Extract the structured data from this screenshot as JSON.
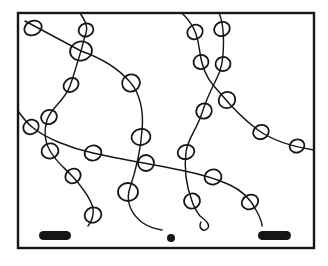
{
  "figure": {
    "canvas": {
      "width": 328,
      "height": 266,
      "background": "#ffffff"
    },
    "ink_color": "#161616",
    "frame": {
      "x": 18,
      "y": 13,
      "width": 296,
      "height": 235,
      "stroke_width": 2.4
    },
    "strand_stroke_width": 1.45,
    "bead_stroke_width": 1.8,
    "strands": [
      {
        "name": "strand-top-left-diagonal",
        "path": "M 25 21 L 81 51 C 101 58 118 68 130 82 C 140 93 144 112 142 130 C 141 148 136 170 129 191 C 126 204 133 216 143 223 C 149 227 156 229 162 230"
      },
      {
        "name": "strand-left-vertical",
        "path": "M 80 13 C 86 22 88 27 86 33 C 83 42 83 44 81 51 C 76 66 75 72 70 86 C 64 102 51 107 47 120 C 44 130 44 141 50 151 C 58 164 65 168 73 177 C 82 187 90 197 93 208 C 94 216 92 221 88 226"
      },
      {
        "name": "strand-middle-s-curve",
        "path": "M 219 13 C 223 22 224 40 223 55 C 222 68 219 74 215 82 C 208 96 206 100 202 113 C 196 131 188 138 186 152 C 184 168 186 185 192 201 C 194 208 197 212 200 216 C 207 221 211 226 207 229 C 203 232 198 228 201 222"
      },
      {
        "name": "strand-right-sweep",
        "path": "M 182 13 C 189 20 193 25 196 34 C 200 46 199 52 202 63 C 206 78 212 84 220 93 C 230 105 243 119 258 130 C 273 141 295 147 314 150"
      },
      {
        "name": "strand-long-horizontal",
        "path": "M 18 111 C 23 118 26 122 32 127 C 45 138 70 148 93 153 C 120 159 150 164 180 170 C 200 174 215 178 230 185 C 243 191 251 200 256 210 C 260 217 262 221 262 226"
      }
    ],
    "beads": [
      {
        "cx": 33,
        "cy": 28,
        "rx": 9,
        "ry": 7,
        "rot": -25
      },
      {
        "cx": 81,
        "cy": 51,
        "rx": 11,
        "ry": 9.5,
        "rot": -10
      },
      {
        "cx": 131,
        "cy": 83,
        "rx": 9,
        "ry": 8.5,
        "rot": -30
      },
      {
        "cx": 141,
        "cy": 137,
        "rx": 9.5,
        "ry": 8,
        "rot": -10
      },
      {
        "cx": 128,
        "cy": 192,
        "rx": 10,
        "ry": 9,
        "rot": 0
      },
      {
        "cx": 86,
        "cy": 30,
        "rx": 7.5,
        "ry": 6.5,
        "rot": -20
      },
      {
        "cx": 71,
        "cy": 85,
        "rx": 8,
        "ry": 6.5,
        "rot": -35
      },
      {
        "cx": 49,
        "cy": 117,
        "rx": 8,
        "ry": 7,
        "rot": -20
      },
      {
        "cx": 50,
        "cy": 151,
        "rx": 8.5,
        "ry": 7.5,
        "rot": -10
      },
      {
        "cx": 73,
        "cy": 176,
        "rx": 8,
        "ry": 7,
        "rot": -35
      },
      {
        "cx": 93,
        "cy": 215,
        "rx": 8.5,
        "ry": 7.5,
        "rot": -20
      },
      {
        "cx": 222,
        "cy": 29,
        "rx": 8,
        "ry": 7,
        "rot": -25
      },
      {
        "cx": 223,
        "cy": 64,
        "rx": 7.5,
        "ry": 7,
        "rot": -10
      },
      {
        "cx": 204,
        "cy": 111,
        "rx": 8,
        "ry": 7.5,
        "rot": -40
      },
      {
        "cx": 186,
        "cy": 152,
        "rx": 8.5,
        "ry": 7,
        "rot": -20
      },
      {
        "cx": 192,
        "cy": 201,
        "rx": 8,
        "ry": 7.5,
        "rot": -15
      },
      {
        "cx": 195,
        "cy": 32,
        "rx": 8,
        "ry": 7,
        "rot": -30
      },
      {
        "cx": 201,
        "cy": 62,
        "rx": 7.5,
        "ry": 7,
        "rot": -15
      },
      {
        "cx": 227,
        "cy": 100,
        "rx": 8.5,
        "ry": 8,
        "rot": -40
      },
      {
        "cx": 261,
        "cy": 132,
        "rx": 8,
        "ry": 7,
        "rot": -25
      },
      {
        "cx": 297,
        "cy": 146,
        "rx": 7.5,
        "ry": 6.5,
        "rot": -20
      },
      {
        "cx": 31,
        "cy": 127,
        "rx": 8,
        "ry": 7,
        "rot": -30
      },
      {
        "cx": 93,
        "cy": 153,
        "rx": 8.5,
        "ry": 7.5,
        "rot": -15
      },
      {
        "cx": 146,
        "cy": 163,
        "rx": 8,
        "ry": 8,
        "rot": 0
      },
      {
        "cx": 213,
        "cy": 177,
        "rx": 8.5,
        "ry": 7.5,
        "rot": -10
      },
      {
        "cx": 250,
        "cy": 202,
        "rx": 8.5,
        "ry": 7,
        "rot": -25
      }
    ],
    "markers": {
      "scale_bar_left": {
        "x": 39,
        "y": 231,
        "width": 32,
        "height": 9,
        "radius": 4.5
      },
      "dot": {
        "cx": 171,
        "cy": 238,
        "r": 4
      },
      "scale_bar_right": {
        "x": 258,
        "y": 231,
        "width": 33,
        "height": 9,
        "radius": 4.5
      }
    }
  }
}
